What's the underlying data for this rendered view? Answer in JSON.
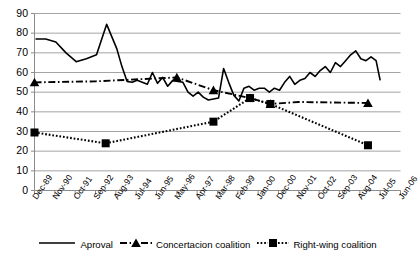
{
  "chart_data": {
    "type": "line",
    "title": "",
    "xlabel": "",
    "ylabel": "",
    "ylim": [
      0,
      90
    ],
    "ytick_step": 10,
    "grid": true,
    "legend_position": "bottom",
    "categories": [
      "Dec-89",
      "Nov-90",
      "Oct-91",
      "Sep-92",
      "Aug-93",
      "Jul-94",
      "Jun-95",
      "May-96",
      "Apr-97",
      "Mar-98",
      "Feb-99",
      "Jan-00",
      "Dec-00",
      "Nov-01",
      "Oct-02",
      "Sep-03",
      "Aug-04",
      "Jul-05",
      "Jun-06"
    ],
    "yticks": [
      0,
      10,
      20,
      30,
      40,
      50,
      60,
      70,
      80,
      90
    ],
    "series": [
      {
        "name": "Aproval",
        "style": "solid",
        "marker": "none",
        "color": "#000000",
        "x": [
          1.05,
          1.55,
          2.05,
          2.55,
          3.05,
          3.55,
          4.05,
          4.55,
          5.05,
          5.3,
          5.55,
          5.8,
          6.05,
          6.3,
          6.55,
          6.8,
          7.05,
          7.3,
          7.55,
          7.8,
          8.05,
          8.3,
          8.55,
          8.8,
          9.05,
          9.3,
          9.55,
          9.8,
          10.05,
          10.3,
          10.55,
          10.8,
          11.05,
          11.3,
          11.55,
          11.8,
          12.05,
          12.3,
          12.55,
          12.8,
          13.05,
          13.3,
          13.55,
          13.8,
          14.05,
          14.3,
          14.55,
          14.8,
          15.05,
          15.3,
          15.55,
          15.8,
          16.05,
          16.3,
          16.55,
          16.8,
          17.05,
          17.3,
          17.55,
          17.8,
          18.0
        ],
        "values": [
          77,
          77,
          75.5,
          70,
          65.5,
          67,
          69,
          84.5,
          72,
          63,
          55.5,
          55,
          56,
          55,
          54,
          60,
          54.5,
          57.5,
          53,
          56,
          55.5,
          55,
          50,
          48,
          50,
          47.5,
          46,
          46.5,
          47,
          62,
          55,
          48.5,
          45.5,
          52,
          53,
          51,
          52,
          52,
          50,
          52,
          51,
          55,
          58,
          54,
          56,
          57,
          60,
          58,
          61,
          63,
          60,
          65,
          63,
          66,
          69,
          71,
          67,
          66,
          68,
          66,
          56
        ]
      },
      {
        "name": "Concertacion coalition",
        "style": "dashdot",
        "marker": "triangle",
        "color": "#000000",
        "x": [
          1,
          4,
          8,
          9.8,
          11.6,
          12.6,
          14.0,
          17.4
        ],
        "values": [
          55,
          55.5,
          57.5,
          51,
          47,
          44,
          45,
          44.5
        ],
        "marker_x": [
          1,
          8,
          9.8,
          11.6,
          12.6,
          17.4
        ],
        "marker_values": [
          55,
          57.5,
          51,
          47,
          44,
          44.5
        ]
      },
      {
        "name": "Right-wing coalition",
        "style": "dotted",
        "marker": "square",
        "color": "#000000",
        "x": [
          1,
          4.5,
          9.8,
          11.6,
          12.6,
          17.4
        ],
        "values": [
          29.5,
          24,
          35,
          47,
          44,
          23
        ],
        "marker_x": [
          1,
          4.5,
          9.8,
          11.6,
          12.6,
          17.4
        ],
        "marker_values": [
          29.5,
          24,
          35,
          47,
          44,
          23
        ]
      }
    ]
  },
  "legend": {
    "items": [
      {
        "label": "Aproval",
        "key": "solid-line"
      },
      {
        "label": "Concertacion coalition",
        "key": "dashdot-triangle"
      },
      {
        "label": "Right-wing coalition",
        "key": "dotted-square"
      }
    ]
  }
}
